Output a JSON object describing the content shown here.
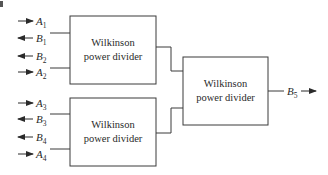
{
  "diagram": {
    "type": "power combiner tree",
    "blocks": [
      {
        "id": "wpd1",
        "line1": "Wilkinson",
        "line2": "power divider"
      },
      {
        "id": "wpd2",
        "line1": "Wilkinson",
        "line2": "power divider"
      },
      {
        "id": "wpd3",
        "line1": "Wilkinson",
        "line2": "power divider"
      }
    ],
    "ports": {
      "a1": {
        "name": "A",
        "sub": "1",
        "direction": "in"
      },
      "b1": {
        "name": "B",
        "sub": "1",
        "direction": "out"
      },
      "b2": {
        "name": "B",
        "sub": "2",
        "direction": "out"
      },
      "a2": {
        "name": "A",
        "sub": "2",
        "direction": "in"
      },
      "a3": {
        "name": "A",
        "sub": "3",
        "direction": "in"
      },
      "b3": {
        "name": "B",
        "sub": "3",
        "direction": "out"
      },
      "b4": {
        "name": "B",
        "sub": "4",
        "direction": "out"
      },
      "a4": {
        "name": "A",
        "sub": "4",
        "direction": "in"
      },
      "b5": {
        "name": "B",
        "sub": "5",
        "direction": "out"
      }
    },
    "colors": {
      "stroke": "#3a3a3a",
      "background": "#ffffff"
    }
  }
}
